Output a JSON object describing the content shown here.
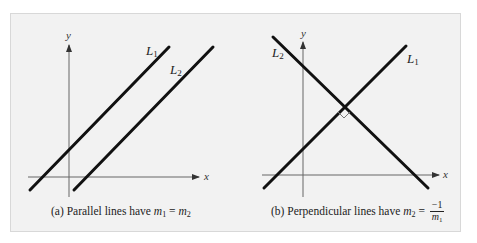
{
  "figure": {
    "background": "#f2f2f2",
    "border_color": "#d8d8d8",
    "line_color": "#111111",
    "axis_color": "#555555"
  },
  "panel_a": {
    "y_axis_label": "y",
    "x_axis_label": "x",
    "line1": {
      "name": "L",
      "sub": "1"
    },
    "line2": {
      "name": "L",
      "sub": "2"
    },
    "caption": {
      "prefix": "(a) Parallel lines have ",
      "lhs_var": "m",
      "lhs_sub": "1",
      "equals": " = ",
      "rhs_var": "m",
      "rhs_sub": "2"
    }
  },
  "panel_b": {
    "y_axis_label": "y",
    "x_axis_label": "x",
    "line1": {
      "name": "L",
      "sub": "1"
    },
    "line2": {
      "name": "L",
      "sub": "2"
    },
    "right_angle_marker": true,
    "caption": {
      "prefix": "(b) Perpendicular lines have ",
      "lhs_var": "m",
      "lhs_sub": "2",
      "equals": " = ",
      "numerator": "−1",
      "denominator_var": "m",
      "denominator_sub": "1"
    }
  }
}
